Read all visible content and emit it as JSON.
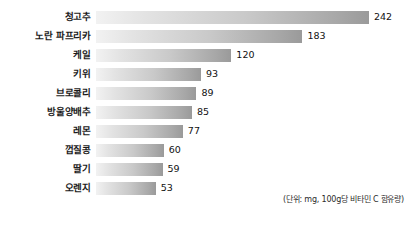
{
  "chart_data": {
    "type": "bar",
    "orientation": "horizontal",
    "title": "",
    "subtitle": "",
    "xlabel": "",
    "ylabel": "",
    "categories": [
      "청고추",
      "노란 파프리카",
      "케일",
      "키위",
      "브로콜리",
      "방울양배추",
      "레몬",
      "껍질콩",
      "딸기",
      "오렌지"
    ],
    "values": [
      242,
      183,
      120,
      93,
      89,
      85,
      77,
      60,
      59,
      53
    ],
    "value_labels": [
      "242",
      "183",
      "120",
      "93",
      "89",
      "85",
      "77",
      "60",
      "59",
      "53"
    ],
    "xlim": [
      0,
      242
    ],
    "grid": false,
    "legend": false,
    "annotation": "(단위: mg, 100g당 비타민 C 함유량)",
    "bar_gradient_start": "#f2f2f2",
    "bar_gradient_end": "#9a9a9a",
    "label_color": "#1a1a1a",
    "value_color": "#111111"
  }
}
